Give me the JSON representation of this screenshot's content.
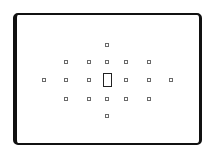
{
  "diagram": {
    "type": "viewfinder-af-points",
    "frame": {
      "left": 13,
      "top": 13,
      "right": 202,
      "bottom": 145,
      "color": "#111111"
    },
    "point_size": 4,
    "point_color": "#6a6a6a",
    "center_point": {
      "x": 103,
      "y": 73,
      "width": 9,
      "height": 14,
      "color": "#222222"
    },
    "points": [
      {
        "x": 107,
        "y": 45
      },
      {
        "x": 66,
        "y": 62
      },
      {
        "x": 89,
        "y": 62
      },
      {
        "x": 107,
        "y": 62
      },
      {
        "x": 126,
        "y": 62
      },
      {
        "x": 149,
        "y": 62
      },
      {
        "x": 44,
        "y": 80
      },
      {
        "x": 66,
        "y": 80
      },
      {
        "x": 89,
        "y": 80
      },
      {
        "x": 126,
        "y": 80
      },
      {
        "x": 149,
        "y": 80
      },
      {
        "x": 171,
        "y": 80
      },
      {
        "x": 66,
        "y": 99
      },
      {
        "x": 89,
        "y": 99
      },
      {
        "x": 107,
        "y": 99
      },
      {
        "x": 126,
        "y": 99
      },
      {
        "x": 149,
        "y": 99
      },
      {
        "x": 107,
        "y": 116
      }
    ]
  }
}
